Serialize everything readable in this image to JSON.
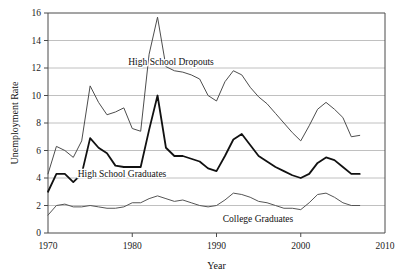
{
  "chart_data": {
    "type": "line",
    "title": "",
    "xlabel": "Year",
    "ylabel": "Unemployment Rate",
    "xlim": [
      1970,
      2010
    ],
    "ylim": [
      0,
      16
    ],
    "xticks": [
      "1970",
      "1980",
      "1990",
      "2000",
      "2010"
    ],
    "yticks": [
      "0",
      "2",
      "4",
      "6",
      "8",
      "10",
      "12",
      "14",
      "16"
    ],
    "grid": "horizontal",
    "legend_position": "inline-annotations",
    "x": [
      1970,
      1971,
      1972,
      1973,
      1974,
      1975,
      1976,
      1977,
      1978,
      1979,
      1980,
      1981,
      1982,
      1983,
      1984,
      1985,
      1986,
      1987,
      1988,
      1989,
      1990,
      1991,
      1992,
      1993,
      1994,
      1995,
      1996,
      1997,
      1998,
      1999,
      2000,
      2001,
      2002,
      2003,
      2004,
      2005,
      2006,
      2007
    ],
    "series": [
      {
        "name": "High School Dropouts",
        "color": "#4d4d4d",
        "width": 1.0,
        "values": [
          4.3,
          6.3,
          6.0,
          5.5,
          6.7,
          10.7,
          9.5,
          8.6,
          8.8,
          9.1,
          7.6,
          7.4,
          13.0,
          15.7,
          12.1,
          11.8,
          11.7,
          11.5,
          11.2,
          10.0,
          9.6,
          11.0,
          11.8,
          11.5,
          10.6,
          9.9,
          9.4,
          8.7,
          8.0,
          7.3,
          6.7,
          7.8,
          9.0,
          9.5,
          9.0,
          8.4,
          7.0,
          7.1
        ]
      },
      {
        "name": "High School Graduates",
        "color": "#111111",
        "width": 1.8,
        "values": [
          3.0,
          4.3,
          4.3,
          3.7,
          4.3,
          6.9,
          6.2,
          5.8,
          4.9,
          4.8,
          4.8,
          4.8,
          7.5,
          10.0,
          6.2,
          5.6,
          5.6,
          5.4,
          5.2,
          4.7,
          4.5,
          5.6,
          6.8,
          7.2,
          6.4,
          5.6,
          5.2,
          4.8,
          4.5,
          4.2,
          4.0,
          4.3,
          5.1,
          5.5,
          5.3,
          4.8,
          4.3,
          4.3
        ]
      },
      {
        "name": "College Graduates",
        "color": "#555555",
        "width": 1.0,
        "values": [
          1.3,
          2.0,
          2.1,
          1.9,
          1.9,
          2.0,
          1.9,
          1.8,
          1.8,
          1.9,
          2.2,
          2.2,
          2.5,
          2.7,
          2.5,
          2.3,
          2.4,
          2.2,
          2.0,
          1.9,
          2.0,
          2.4,
          2.9,
          2.8,
          2.6,
          2.3,
          2.2,
          2.0,
          1.8,
          1.8,
          1.7,
          2.2,
          2.8,
          2.9,
          2.6,
          2.2,
          2.0,
          2.0
        ]
      }
    ],
    "annotations": [
      {
        "text": "High School Dropouts",
        "x_px": 171,
        "y_px": 65
      },
      {
        "text": "High School Graduates",
        "x_px": 122,
        "y_px": 177
      },
      {
        "text": "College Graduates",
        "x_px": 258,
        "y_px": 222
      }
    ]
  }
}
